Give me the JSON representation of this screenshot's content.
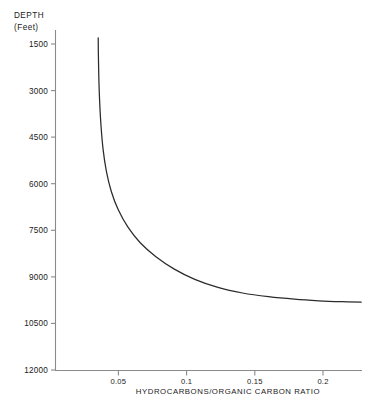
{
  "chart_data": {
    "type": "line",
    "title": "",
    "subtitle": "",
    "xlabel": "HYDROCARBONS/ORGANIC  CARBON  RATIO",
    "ylabel": "DEPTH",
    "ylabel_units": "(Feet)",
    "xlim": [
      0.0,
      0.235
    ],
    "ylim": [
      12000,
      750
    ],
    "y_inverted": true,
    "grid": false,
    "legend": null,
    "xticks": [
      0.05,
      0.1,
      0.15,
      0.2
    ],
    "xtick_labels": [
      "0.05",
      "0.1",
      "0.15",
      "0.2"
    ],
    "yticks": [
      1500,
      3000,
      4500,
      6000,
      7500,
      9000,
      10500,
      12000
    ],
    "ytick_labels": [
      "1500",
      "3000",
      "4500",
      "6000",
      "7500",
      "9000",
      "10500",
      "12000"
    ],
    "series": [
      {
        "name": "hydrocarbon-organic-carbon-ratio-vs-depth",
        "x": [
          0.0352,
          0.0353,
          0.0356,
          0.0362,
          0.0372,
          0.0388,
          0.0412,
          0.0448,
          0.05,
          0.057,
          0.066,
          0.0775,
          0.091,
          0.106,
          0.123,
          0.141,
          0.16,
          0.179,
          0.197,
          0.214,
          0.228
        ],
        "y": [
          1300,
          1800,
          2500,
          3300,
          4100,
          4900,
          5600,
          6250,
          6850,
          7400,
          7900,
          8350,
          8750,
          9080,
          9340,
          9520,
          9640,
          9720,
          9770,
          9800,
          9815
        ],
        "note": "Hyperbolic decay: ratio rises sharply as depth increases, approaching an asymptote near 9800 ft."
      }
    ],
    "annotations": []
  },
  "figure": {
    "caption": ""
  }
}
